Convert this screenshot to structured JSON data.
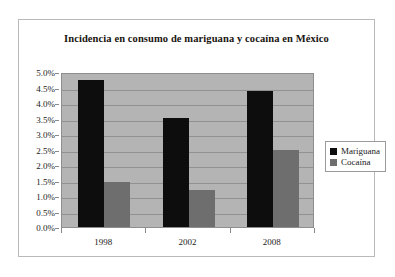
{
  "chart_data": {
    "type": "bar",
    "title": "Incidencia en consumo de mariguana y cocaína en México",
    "xlabel": "",
    "ylabel": "",
    "categories": [
      "1998",
      "2002",
      "2008"
    ],
    "series": [
      {
        "name": "Mariguana",
        "color": "#0d0d0d",
        "values": [
          4.75,
          3.52,
          4.4
        ]
      },
      {
        "name": "Cocaína",
        "color": "#6e6e6e",
        "values": [
          1.45,
          1.2,
          2.47
        ]
      }
    ],
    "ylim": [
      0,
      5
    ],
    "ytick_step": 0.5,
    "ytick_labels": [
      "5.0%",
      "4.5%",
      "4.0%",
      "3.5%",
      "3.0%",
      "2.5%",
      "2.0%",
      "1.5%",
      "1.0%",
      "0.5%",
      "0.0%"
    ],
    "ytick_values": [
      5.0,
      4.5,
      4.0,
      3.5,
      3.0,
      2.5,
      2.0,
      1.5,
      1.0,
      0.5,
      0.0
    ],
    "grid": true,
    "legend_position": "right",
    "plot_background": "#b4b4b4",
    "gridline_color": "#919191"
  }
}
